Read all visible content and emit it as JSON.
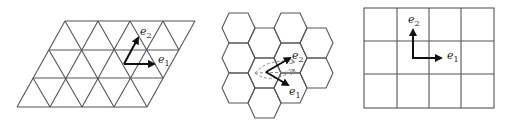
{
  "figure": {
    "panels": [
      {
        "name": "triangular-lattice",
        "vectors": [
          {
            "label": "e",
            "subscript": "1"
          },
          {
            "label": "e",
            "subscript": "2"
          }
        ]
      },
      {
        "name": "hexagonal-lattice",
        "vectors": [
          {
            "label": "e",
            "subscript": "1"
          },
          {
            "label": "e",
            "subscript": "2"
          }
        ]
      },
      {
        "name": "square-lattice",
        "vectors": [
          {
            "label": "e",
            "subscript": "1"
          },
          {
            "label": "e",
            "subscript": "2"
          }
        ]
      }
    ],
    "colors": {
      "lattice": "#555555",
      "vector": "#111111",
      "dashed": "#888888"
    }
  }
}
